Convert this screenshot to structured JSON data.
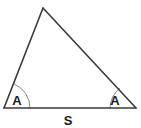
{
  "figure": {
    "type": "geometry-diagram",
    "shape": "triangle",
    "background_color": "#ffffff",
    "stroke_color": "#3a3a3a",
    "arc_color": "#8a8a8a",
    "label_color": "#1b1b1b",
    "stroke_width": 1.6,
    "arc_width": 1.0,
    "vertices": {
      "apex": {
        "x": 43,
        "y": 8
      },
      "bottom_left": {
        "x": 4,
        "y": 108
      },
      "bottom_right": {
        "x": 136,
        "y": 108
      }
    },
    "labels": {
      "angle_left": "A",
      "angle_right": "A",
      "base_side": "S"
    },
    "label_positions": {
      "angle_left": {
        "x": 17,
        "y": 105
      },
      "angle_right": {
        "x": 115,
        "y": 105
      },
      "base_side": {
        "x": 68,
        "y": 125
      }
    },
    "arcs": {
      "left": {
        "center_x": 4,
        "center_y": 108,
        "radius": 26
      },
      "right": {
        "center_x": 136,
        "center_y": 108,
        "radius": 26
      }
    }
  }
}
